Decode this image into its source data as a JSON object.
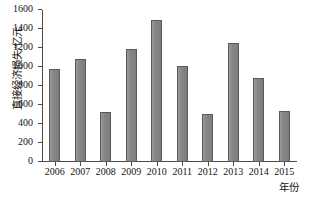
{
  "chart_data": {
    "type": "bar",
    "title": "",
    "xlabel": "年份",
    "ylabel": "直接经济损失/亿元",
    "categories": [
      "2006",
      "2007",
      "2008",
      "2009",
      "2010",
      "2011",
      "2012",
      "2013",
      "2014",
      "2015"
    ],
    "values": [
      980,
      1080,
      530,
      1190,
      1490,
      1010,
      510,
      1250,
      880,
      535
    ],
    "ylim": [
      0,
      1600
    ],
    "ytick_labels": [
      "0",
      "200",
      "400",
      "600",
      "800",
      "1000",
      "1200",
      "1400",
      "1600"
    ],
    "ytick_values": [
      0,
      200,
      400,
      600,
      800,
      1000,
      1200,
      1400,
      1600
    ],
    "grid": false,
    "legend": "none",
    "bar_color": "#8a8a8a",
    "bar_edge_color": "#5a5a5a",
    "axis_color": "#4a4a4a",
    "background_color": "#ffffff"
  }
}
